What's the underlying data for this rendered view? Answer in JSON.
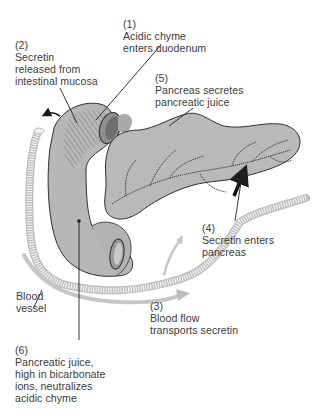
{
  "diagram": {
    "colors": {
      "organ_fill": "#b9b9b9",
      "organ_stroke": "#2e2e2e",
      "vessel": "#d4d4d4",
      "flow_arrow": "#bdbdbd",
      "text": "#3c3c3c",
      "leader": "#1e1e1e"
    },
    "labels": [
      {
        "id": "step-1",
        "number": "(1)",
        "lines": [
          "Acidic chyme",
          "enters duodenum"
        ]
      },
      {
        "id": "step-2",
        "number": "(2)",
        "lines": [
          "Secretin",
          "released from",
          "intestinal mucosa"
        ]
      },
      {
        "id": "step-5",
        "number": "(5)",
        "lines": [
          "Pancreas secretes",
          "pancreatic juice"
        ]
      },
      {
        "id": "step-4",
        "number": "(4)",
        "lines": [
          "Secretin enters",
          "pancreas"
        ]
      },
      {
        "id": "blood-vessel",
        "number": "",
        "lines": [
          "Blood",
          "vessel"
        ]
      },
      {
        "id": "step-3",
        "number": "(3)",
        "lines": [
          "Blood flow",
          "transports secretin"
        ]
      },
      {
        "id": "step-6",
        "number": "(6)",
        "lines": [
          "Pancreatic juice,",
          "high in bicarbonate",
          "ions, neutralizes",
          "acidic chyme"
        ]
      }
    ],
    "structures": [
      "duodenum",
      "pancreas",
      "pancreatic-duct",
      "blood-vessel",
      "stomach-outlet",
      "jejunum-outlet"
    ]
  }
}
